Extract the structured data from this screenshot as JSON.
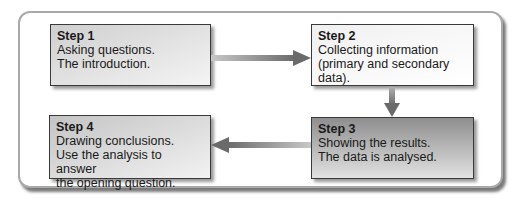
{
  "diagram": {
    "type": "process-flow",
    "steps": [
      {
        "title": "Step 1",
        "lines": [
          "Asking questions.",
          "The introduction."
        ]
      },
      {
        "title": "Step 2",
        "lines": [
          "Collecting information",
          "(primary and secondary data)."
        ]
      },
      {
        "title": "Step 3",
        "lines": [
          "Showing the results.",
          "The data is analysed."
        ]
      },
      {
        "title": "Step 4",
        "lines": [
          "Drawing conclusions.",
          "Use the analysis to answer",
          "the opening question."
        ]
      }
    ],
    "connectors": [
      {
        "from": "Step 1",
        "to": "Step 2",
        "direction": "right"
      },
      {
        "from": "Step 2",
        "to": "Step 3",
        "direction": "down"
      },
      {
        "from": "Step 3",
        "to": "Step 4",
        "direction": "left"
      }
    ],
    "colors": {
      "arrow": "#6e6e6e",
      "border": "#3a3a3a",
      "frame": "#a9a9a9"
    }
  }
}
